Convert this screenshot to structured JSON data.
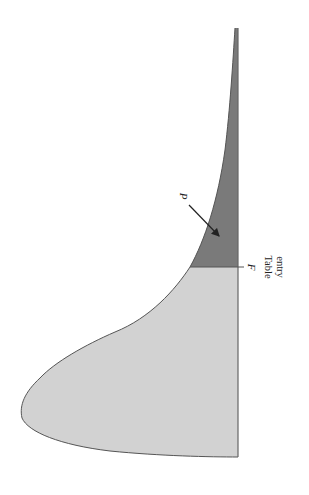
{
  "figure": {
    "labels": {
      "p": "P",
      "f": "F",
      "table_entry_line1": "Table",
      "table_entry_line2": "entry"
    },
    "colors": {
      "body_fill": "#d2d2d2",
      "tail_fill": "#7a7a7a",
      "outline": "#555555",
      "text": "#222222"
    }
  }
}
